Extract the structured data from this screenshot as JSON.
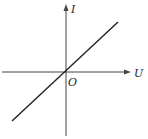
{
  "diagram": {
    "type": "I-U characteristic graph",
    "axes": {
      "x_label": "U",
      "y_label": "I",
      "origin_label": "O"
    },
    "line": {
      "description": "straight line through origin, positive slope",
      "from": [
        12,
        121
      ],
      "to": [
        118,
        22
      ]
    },
    "colors": {
      "stroke": "#222222",
      "axis": "#444444",
      "background": "#ffffff"
    }
  }
}
